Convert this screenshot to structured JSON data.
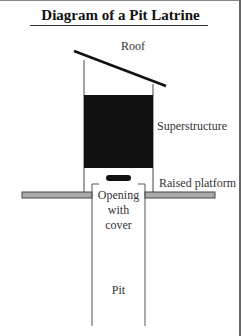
{
  "diagram": {
    "title": "Diagram of a Pit Latrine",
    "labels": {
      "roof": "Roof",
      "superstructure": "Superstructure",
      "raised_platform": "Raised platform",
      "opening_line1": "Opening",
      "opening_line2": "with",
      "opening_line3": "cover",
      "pit": "Pit"
    },
    "colors": {
      "superstructure_fill": "#111111",
      "platform_fill": "#aaaaaa",
      "line": "#222222",
      "wall": "#555555"
    }
  }
}
